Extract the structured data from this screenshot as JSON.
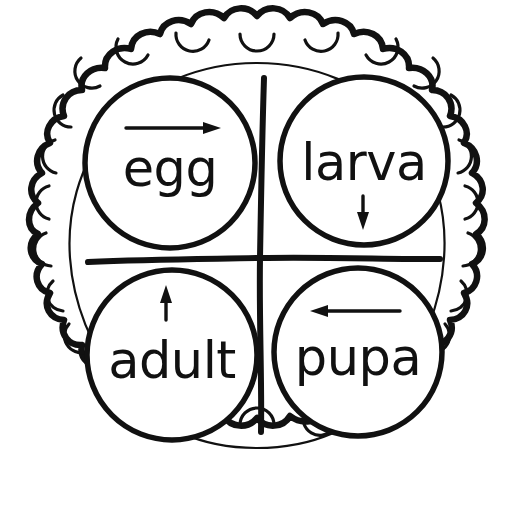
{
  "diagram": {
    "type": "cycle-diagram",
    "colors": {
      "ink": "#111111",
      "paper": "#ffffff"
    },
    "outer_border": {
      "name": "scalloped-plate-border",
      "scallop_count": 26,
      "style": "wavy hand-drawn scallops with small inner tick arcs"
    },
    "inner_plate": {
      "name": "inner-plate-circle",
      "style": "thin hand-drawn circle"
    },
    "divider": {
      "name": "quadrant-cross",
      "vertical_label": "vertical-divider",
      "horizontal_label": "horizontal-divider"
    },
    "quadrants": [
      {
        "id": "egg",
        "label": "egg",
        "position": "top-left",
        "arrow": {
          "name": "arrow-right-icon",
          "direction": "right",
          "glyph": "→",
          "placement": "above-label",
          "meaning": "egg leads to larva"
        }
      },
      {
        "id": "larva",
        "label": "larva",
        "position": "top-right",
        "arrow": {
          "name": "arrow-down-icon",
          "direction": "down",
          "glyph": "↓",
          "placement": "below-label",
          "meaning": "larva leads to pupa"
        }
      },
      {
        "id": "adult",
        "label": "adult",
        "position": "bottom-left",
        "arrow": {
          "name": "arrow-up-icon",
          "direction": "up",
          "glyph": "↑",
          "placement": "above-label",
          "meaning": "adult leads to egg"
        }
      },
      {
        "id": "pupa",
        "label": "pupa",
        "position": "bottom-right",
        "arrow": {
          "name": "arrow-left-icon",
          "direction": "left",
          "glyph": "←",
          "placement": "above-label",
          "meaning": "pupa leads to adult"
        }
      }
    ],
    "cycle_order": [
      "egg",
      "larva",
      "pupa",
      "adult"
    ]
  }
}
